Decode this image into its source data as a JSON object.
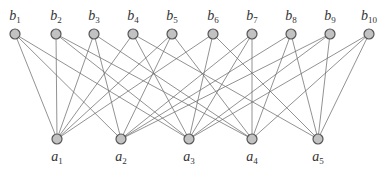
{
  "diagram": {
    "type": "bipartite-graph",
    "colors": {
      "edge": "#6e6e6e",
      "node_fill": "#c2c2c2",
      "node_stroke": "#555555",
      "label": "#333333"
    },
    "top_nodes": [
      {
        "id": "b1",
        "base": "b",
        "sub": "1",
        "x": 15,
        "y": 34
      },
      {
        "id": "b2",
        "base": "b",
        "sub": "2",
        "x": 56,
        "y": 34
      },
      {
        "id": "b3",
        "base": "b",
        "sub": "3",
        "x": 94,
        "y": 34
      },
      {
        "id": "b4",
        "base": "b",
        "sub": "4",
        "x": 133,
        "y": 34
      },
      {
        "id": "b5",
        "base": "b",
        "sub": "5",
        "x": 172,
        "y": 34
      },
      {
        "id": "b6",
        "base": "b",
        "sub": "6",
        "x": 213,
        "y": 34
      },
      {
        "id": "b7",
        "base": "b",
        "sub": "7",
        "x": 252,
        "y": 34
      },
      {
        "id": "b8",
        "base": "b",
        "sub": "8",
        "x": 291,
        "y": 34
      },
      {
        "id": "b9",
        "base": "b",
        "sub": "9",
        "x": 330,
        "y": 34
      },
      {
        "id": "b10",
        "base": "b",
        "sub": "10",
        "x": 369,
        "y": 34
      }
    ],
    "bottom_nodes": [
      {
        "id": "a1",
        "base": "a",
        "sub": "1",
        "x": 57,
        "y": 139
      },
      {
        "id": "a2",
        "base": "a",
        "sub": "2",
        "x": 121,
        "y": 139
      },
      {
        "id": "a3",
        "base": "a",
        "sub": "3",
        "x": 189,
        "y": 139
      },
      {
        "id": "a4",
        "base": "a",
        "sub": "4",
        "x": 252,
        "y": 139
      },
      {
        "id": "a5",
        "base": "a",
        "sub": "5",
        "x": 318,
        "y": 139
      }
    ],
    "edges": [
      [
        "b1",
        "a1"
      ],
      [
        "b1",
        "a2"
      ],
      [
        "b1",
        "a3"
      ],
      [
        "b2",
        "a1"
      ],
      [
        "b2",
        "a3"
      ],
      [
        "b2",
        "a4"
      ],
      [
        "b3",
        "a1"
      ],
      [
        "b3",
        "a2"
      ],
      [
        "b3",
        "a4"
      ],
      [
        "b4",
        "a1"
      ],
      [
        "b4",
        "a3"
      ],
      [
        "b4",
        "a5"
      ],
      [
        "b5",
        "a1"
      ],
      [
        "b5",
        "a2"
      ],
      [
        "b5",
        "a4"
      ],
      [
        "b6",
        "a1"
      ],
      [
        "b6",
        "a3"
      ],
      [
        "b6",
        "a5"
      ],
      [
        "b7",
        "a2"
      ],
      [
        "b7",
        "a3"
      ],
      [
        "b7",
        "a4"
      ],
      [
        "b8",
        "a2"
      ],
      [
        "b8",
        "a4"
      ],
      [
        "b8",
        "a5"
      ],
      [
        "b9",
        "a2"
      ],
      [
        "b9",
        "a3"
      ],
      [
        "b9",
        "a5"
      ],
      [
        "b10",
        "a3"
      ],
      [
        "b10",
        "a4"
      ],
      [
        "b10",
        "a5"
      ]
    ]
  }
}
